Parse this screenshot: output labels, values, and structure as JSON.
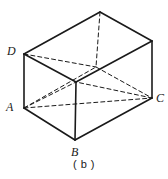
{
  "figure": {
    "caption": "( b )",
    "type": "3d-line-diagram",
    "background_color": "#ffffff",
    "stroke_color": "#1a1a1a",
    "solid_stroke_width": 1.6,
    "hidden_stroke_width": 1.0,
    "hidden_dash_pattern": "4,3",
    "labels": [
      {
        "id": "D",
        "text": "D",
        "x": 7,
        "y": 45
      },
      {
        "id": "A",
        "text": "A",
        "x": 6,
        "y": 101
      },
      {
        "id": "C",
        "text": "C",
        "x": 156,
        "y": 92
      },
      {
        "id": "B",
        "text": "B",
        "x": 71,
        "y": 146
      }
    ],
    "vertices": {
      "D_top_front_left": {
        "x": 24,
        "y": 54
      },
      "A_bottom_front_left": {
        "x": 24,
        "y": 108
      },
      "B_bottom_front": {
        "x": 75,
        "y": 140
      },
      "C_bottom_right": {
        "x": 152,
        "y": 98
      },
      "top_front_mid": {
        "x": 76,
        "y": 82
      },
      "top_right": {
        "x": 152,
        "y": 41
      },
      "top_rear_apex": {
        "x": 100,
        "y": 12
      },
      "hidden_rear_bottom": {
        "x": 96,
        "y": 67
      }
    },
    "solid_edges": [
      {
        "name": "left-vertical-DA",
        "from": "D_top_front_left",
        "to": "A_bottom_front_left"
      },
      {
        "name": "front-bottom-AB",
        "from": "A_bottom_front_left",
        "to": "B_bottom_front"
      },
      {
        "name": "front-bottom-BC",
        "from": "B_bottom_front",
        "to": "C_bottom_right"
      },
      {
        "name": "interior-vertical",
        "from": "top_front_mid",
        "to": "B_bottom_front"
      },
      {
        "name": "top-left-D-mid",
        "from": "D_top_front_left",
        "to": "top_front_mid"
      },
      {
        "name": "top-mid-right",
        "from": "top_front_mid",
        "to": "top_right"
      },
      {
        "name": "right-vertical",
        "from": "top_right",
        "to": "C_bottom_right"
      },
      {
        "name": "top-rear-left",
        "from": "D_top_front_left",
        "to": "top_rear_apex"
      },
      {
        "name": "top-rear-right",
        "from": "top_rear_apex",
        "to": "top_right"
      }
    ],
    "hidden_edges": [
      {
        "name": "rear-vertical-dashed",
        "from": "top_rear_apex",
        "to": "hidden_rear_bottom"
      },
      {
        "name": "hidden-A-rear",
        "from": "A_bottom_front_left",
        "to": "hidden_rear_bottom"
      },
      {
        "name": "hidden-rear-C",
        "from": "hidden_rear_bottom",
        "to": "C_bottom_right"
      },
      {
        "name": "diagonal-A-C",
        "from": "A_bottom_front_left",
        "to": "C_bottom_right"
      },
      {
        "name": "diagonal-A-topmid",
        "from": "A_bottom_front_left",
        "to": "top_front_mid"
      },
      {
        "name": "diagonal-C-topmid",
        "from": "C_bottom_right",
        "to": "top_front_mid"
      },
      {
        "name": "diagonal-D-rear",
        "from": "D_top_front_left",
        "to": "hidden_rear_bottom"
      }
    ]
  }
}
